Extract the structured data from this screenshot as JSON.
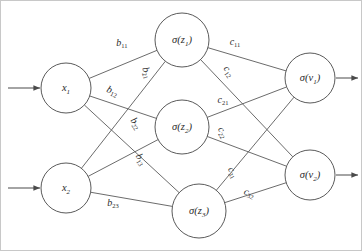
{
  "diagram": {
    "type": "neural-network",
    "background_color": "#ffffff",
    "stroke_color": "#5a5a5a",
    "text_color": "#2b2b2b",
    "layers": [
      {
        "name": "input-layer",
        "nodes": [
          {
            "id": "x1",
            "label": "x",
            "sub": "1",
            "cx": 66,
            "cy": 88,
            "r": 25
          },
          {
            "id": "x2",
            "label": "x",
            "sub": "2",
            "cx": 66,
            "cy": 188,
            "r": 25
          }
        ]
      },
      {
        "name": "hidden-layer",
        "nodes": [
          {
            "id": "z1",
            "label": "σ(z",
            "sub": "1",
            "tail": ")",
            "cx": 182,
            "cy": 40,
            "r": 27
          },
          {
            "id": "z2",
            "label": "σ(z",
            "sub": "2",
            "tail": ")",
            "cx": 182,
            "cy": 127,
            "r": 27
          },
          {
            "id": "z3",
            "label": "σ(z",
            "sub": "3",
            "tail": ")",
            "cx": 199,
            "cy": 211,
            "r": 27
          }
        ]
      },
      {
        "name": "output-layer",
        "nodes": [
          {
            "id": "v1",
            "label": "σ(v",
            "sub": "1",
            "tail": ")",
            "cx": 310,
            "cy": 78,
            "r": 25
          },
          {
            "id": "v2",
            "label": "σ(v",
            "sub": "2",
            "tail": ")",
            "cx": 310,
            "cy": 175,
            "r": 25
          }
        ]
      }
    ],
    "input_arrows": [
      {
        "name": "input-arrow-x1",
        "x1": 8,
        "y1": 88,
        "x2": 40,
        "y2": 88
      },
      {
        "name": "input-arrow-x2",
        "x1": 8,
        "y1": 188,
        "x2": 40,
        "y2": 188
      }
    ],
    "output_arrows": [
      {
        "name": "output-arrow-v1",
        "x1": 336,
        "y1": 78,
        "x2": 358,
        "y2": 78
      },
      {
        "name": "output-arrow-v2",
        "x1": 336,
        "y1": 175,
        "x2": 358,
        "y2": 175
      }
    ],
    "edges": [
      {
        "name": "edge-x1-z1",
        "from": "x1",
        "to": "z1",
        "weight": "b",
        "sub": "11",
        "lx": 122,
        "ly": 44,
        "rot": 0
      },
      {
        "name": "edge-x1-z2",
        "from": "x1",
        "to": "z2",
        "weight": "b",
        "sub": "12",
        "lx": 112,
        "ly": 92,
        "rot": 24
      },
      {
        "name": "edge-x1-z3",
        "from": "x1",
        "to": "z3",
        "weight": "b",
        "sub": "13",
        "lx": 140,
        "ly": 160,
        "rot": 62
      },
      {
        "name": "edge-x2-z1",
        "from": "x2",
        "to": "z1",
        "weight": "b",
        "sub": "21",
        "lx": 146,
        "ly": 73,
        "rot": 72
      },
      {
        "name": "edge-x2-z2",
        "from": "x2",
        "to": "z2",
        "weight": "b",
        "sub": "22",
        "lx": 135,
        "ly": 124,
        "rot": 56
      },
      {
        "name": "edge-x2-z3",
        "from": "x2",
        "to": "z3",
        "weight": "b",
        "sub": "23",
        "lx": 113,
        "ly": 204,
        "rot": 0
      },
      {
        "name": "edge-z1-v1",
        "from": "z1",
        "to": "v1",
        "weight": "c",
        "sub": "11",
        "lx": 235,
        "ly": 43,
        "rot": 0
      },
      {
        "name": "edge-z1-v2",
        "from": "z1",
        "to": "v2",
        "weight": "c",
        "sub": "12",
        "lx": 228,
        "ly": 72,
        "rot": 56
      },
      {
        "name": "edge-z2-v1",
        "from": "z2",
        "to": "v1",
        "weight": "c",
        "sub": "21",
        "lx": 223,
        "ly": 101,
        "rot": 0
      },
      {
        "name": "edge-z2-v2",
        "from": "z2",
        "to": "v2",
        "weight": "c",
        "sub": "22",
        "lx": 222,
        "ly": 133,
        "rot": 62
      },
      {
        "name": "edge-z3-v1",
        "from": "z3",
        "to": "v1",
        "weight": "c",
        "sub": "31",
        "lx": 232,
        "ly": 173,
        "rot": 63
      },
      {
        "name": "edge-z3-v2",
        "from": "z3",
        "to": "v2",
        "weight": "c",
        "sub": "32",
        "lx": 249,
        "ly": 194,
        "rot": 22
      }
    ]
  }
}
